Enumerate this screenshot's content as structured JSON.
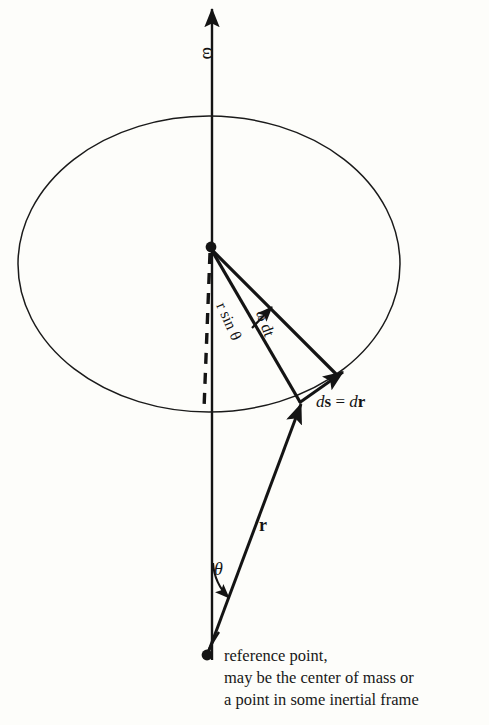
{
  "figure": {
    "background_color": "#fdfdfa",
    "ink_color": "#141414"
  },
  "labels": {
    "omega_axis": "ω",
    "r_sin_theta": "r sin θ",
    "omega_dt": "ω dt",
    "ds_equals_dr_d1": "d",
    "ds_equals_dr_s": "s",
    "ds_equals_dr_eq": " = ",
    "ds_equals_dr_d2": "d",
    "ds_equals_dr_r": "r",
    "r_vector": "r",
    "theta": "θ"
  },
  "caption": {
    "line1": "reference point,",
    "line2": "may be the center of mass or",
    "line3": "a point in some inertial frame"
  },
  "icons": {
    "omega_arrow": "up-arrow-icon",
    "ds_arrow": "displacement-arrow-icon",
    "omega_dt_arrow": "angle-arrow-icon",
    "theta_arrow": "angle-pointer-arrow-icon",
    "r_arrow": "radius-arrow-icon",
    "origin_dot": "axis-origin-dot-icon",
    "reference_dot": "reference-point-dot-icon"
  },
  "geometry": {
    "rotation_axis": {
      "x": 212,
      "y_top": 5,
      "y_bottom": 660
    },
    "ellipse": {
      "cx": 209,
      "cy": 264,
      "rx": 191,
      "ry": 148
    },
    "axis_point": {
      "x": 211,
      "y": 247
    },
    "reference_point": {
      "x": 207,
      "y": 655
    },
    "circle_point_start": {
      "x": 300,
      "y": 402
    },
    "circle_point_end": {
      "x": 337,
      "y": 378
    }
  }
}
